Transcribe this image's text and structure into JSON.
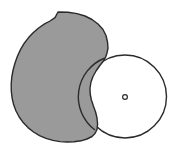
{
  "figure": {
    "title": "Overlapping shapes diagram",
    "canvas": {
      "width": 174,
      "height": 151,
      "background_color": "#ffffff"
    },
    "shapes": [
      {
        "id": "gray-blob",
        "name": "gray-irregular-blob",
        "type": "polygon",
        "fill_color": "#9a9a9a",
        "stroke_color": "#2b2b2b",
        "stroke_width": 1.4,
        "bounds": {
          "x": 11,
          "y": 12,
          "width": 98,
          "height": 130
        },
        "points": "58,12 68,12.3 77,13.6 85,16 92,19.5 98,24 103,29.5 106,35.5 107.5,42 108,48 107,53 105.5,57.5 103,61.5 99.5,66 96,71 93,76.5 91,82 90,88 90.2,94 91.4,100 93.4,106 95.6,112 97,118 97.6,124 97,129.5 95,133.5 92,136.5 87,139 81,140.8 74,141.8 67,142 60,141.6 53,140.4 46,138.4 39.5,135.6 33.5,132 28,127.6 23.2,122.6 19.2,117 16,111 13.6,104.6 12.1,98 11.3,91 11.2,84 11.8,77 13.1,70 15,63 17.5,56 20.6,49.4 24.3,43.2 28.6,37.6 33.4,32.5 38.6,28 44.2,24.2 50,21 55,17.6 58,12"
      },
      {
        "id": "white-circle",
        "name": "white-outlined-circle",
        "type": "circle",
        "fill_color": "#ffffff",
        "stroke_color": "#2b2b2b",
        "stroke_width": 1.4,
        "center": {
          "x": 125,
          "y": 96.5
        },
        "radius": 41.5
      },
      {
        "id": "center-marker",
        "name": "circle-center-dot",
        "type": "ring",
        "fill_color": "#ffffff",
        "stroke_color": "#2b2b2b",
        "stroke_width": 1.2,
        "center": {
          "x": 125,
          "y": 97
        },
        "radius": 2.4
      }
    ],
    "overlap": {
      "note": "gray blob is drawn over the left portion of the circle; the circle outline remains visible across the overlap",
      "intersection_top": {
        "x": 105,
        "y": 58
      },
      "intersection_bottom": {
        "x": 95,
        "y": 130
      }
    }
  }
}
